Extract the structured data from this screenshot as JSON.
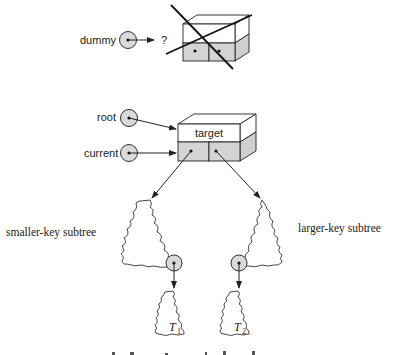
{
  "diagram": {
    "colors": {
      "stroke": "#222222",
      "node_fill_gray": "#d4d4d4",
      "side_fill_gray": "#cfcfcf",
      "pointer_circle_fill": "#d9d9d9",
      "background": "#ffffff"
    },
    "dummy_section": {
      "pointer_label": "dummy",
      "pointer_target": "?",
      "crossed_out_node": true
    },
    "main_section": {
      "pointers": [
        {
          "label": "root",
          "points_to": "target-node"
        },
        {
          "label": "current",
          "points_to": "target-node"
        }
      ],
      "node": {
        "key_label": "target",
        "children": [
          "left",
          "right"
        ]
      }
    },
    "subtrees": {
      "left_label": "smaller-key subtree",
      "right_label": "larger-key subtree"
    },
    "leaf_subtrees": [
      {
        "letter": "T",
        "subscript": "1"
      },
      {
        "letter": "T",
        "subscript": "2"
      }
    ]
  }
}
